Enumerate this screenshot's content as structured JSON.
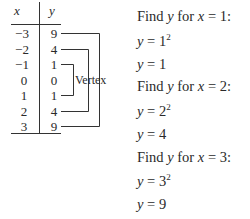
{
  "table": {
    "headers": {
      "x": "x",
      "y": "y"
    },
    "rows": [
      {
        "x": "−3",
        "y": "9"
      },
      {
        "x": "−2",
        "y": "4"
      },
      {
        "x": "−1",
        "y": "1"
      },
      {
        "x": "0",
        "y": "0"
      },
      {
        "x": "1",
        "y": "1"
      },
      {
        "x": "2",
        "y": "4"
      },
      {
        "x": "3",
        "y": "9"
      }
    ],
    "vertex_label": "Vertex",
    "brackets": [
      {
        "from_x": "−1",
        "to_x": "1"
      },
      {
        "from_x": "−2",
        "to_x": "2"
      },
      {
        "from_x": "−3",
        "to_x": "3"
      }
    ]
  },
  "work": [
    {
      "find": "Find",
      "var": "y",
      "for": "for",
      "xvar": "x",
      "eq": "=",
      "xval": "1:",
      "step1": {
        "lhs": "y",
        "eq": "=",
        "base": "1",
        "exp": "2"
      },
      "step2": {
        "lhs": "y",
        "eq": "=",
        "val": "1"
      }
    },
    {
      "find": "Find",
      "var": "y",
      "for": "for",
      "xvar": "x",
      "eq": "=",
      "xval": "2:",
      "step1": {
        "lhs": "y",
        "eq": "=",
        "base": "2",
        "exp": "2"
      },
      "step2": {
        "lhs": "y",
        "eq": "=",
        "val": "4"
      }
    },
    {
      "find": "Find",
      "var": "y",
      "for": "for",
      "xvar": "x",
      "eq": "=",
      "xval": "3:",
      "step1": {
        "lhs": "y",
        "eq": "=",
        "base": "3",
        "exp": "2"
      },
      "step2": {
        "lhs": "y",
        "eq": "=",
        "val": "9"
      }
    }
  ]
}
